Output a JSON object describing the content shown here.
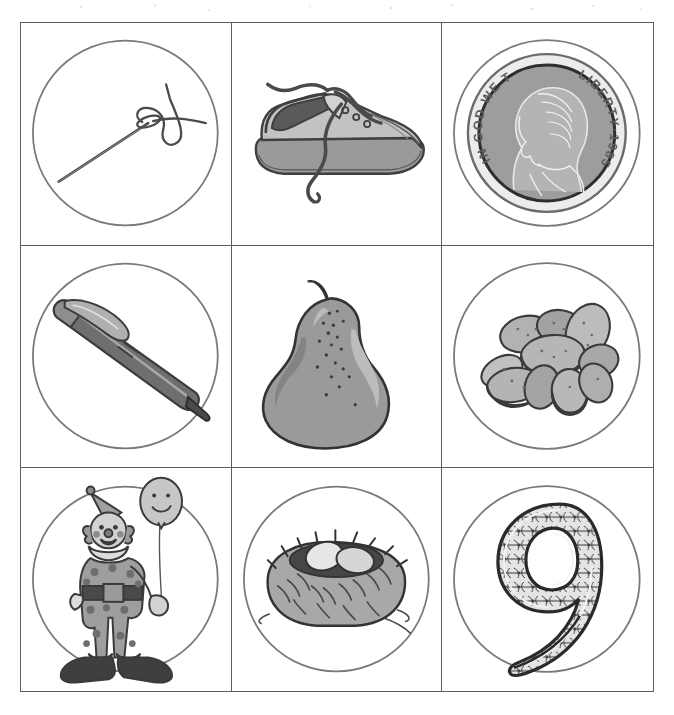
{
  "page": {
    "width": 674,
    "height": 715,
    "background": "#ffffff",
    "border_color": "#5d5d5d",
    "circle_color": "#7a7a7a",
    "ink_color": "#4a4a4a",
    "fill_gray": "#9a9a9a",
    "fill_gray_light": "#bdbdbd",
    "fill_gray_dark": "#6f6f6f"
  },
  "grid": {
    "rows": 3,
    "columns": 3,
    "cells": [
      {
        "index": 1,
        "row": 1,
        "column": 1,
        "item": "needle-and-thread",
        "label": "Needle and thread",
        "has_circle": true,
        "icon_name": "needle-thread-icon"
      },
      {
        "index": 2,
        "row": 1,
        "column": 2,
        "item": "shoe",
        "label": "Shoe",
        "has_circle": false,
        "icon_name": "shoe-icon"
      },
      {
        "index": 3,
        "row": 1,
        "column": 3,
        "item": "nickel-coin",
        "label": "Nickel coin",
        "has_circle": true,
        "icon_name": "nickel-coin-icon",
        "coin_text": {
          "motto": "IN GOD WE TRUST",
          "liberty": "LIBERTY",
          "separator": "·",
          "year": "1985"
        }
      },
      {
        "index": 4,
        "row": 2,
        "column": 1,
        "item": "pen",
        "label": "Pen",
        "has_circle": true,
        "icon_name": "pen-icon"
      },
      {
        "index": 5,
        "row": 2,
        "column": 2,
        "item": "pear",
        "label": "Pear",
        "has_circle": false,
        "icon_name": "pear-icon"
      },
      {
        "index": 6,
        "row": 2,
        "column": 3,
        "item": "nuts",
        "label": "Nuts",
        "has_circle": true,
        "icon_name": "nuts-icon"
      },
      {
        "index": 7,
        "row": 3,
        "column": 1,
        "item": "clown",
        "label": "Clown with balloon",
        "has_circle": true,
        "icon_name": "clown-icon"
      },
      {
        "index": 8,
        "row": 3,
        "column": 2,
        "item": "nest",
        "label": "Nest with eggs",
        "has_circle": true,
        "icon_name": "nest-icon"
      },
      {
        "index": 9,
        "row": 3,
        "column": 3,
        "item": "numeral-nine",
        "label": "Decorative numeral nine",
        "has_circle": true,
        "icon_name": "numeral-nine-icon",
        "numeral": "9"
      }
    ]
  }
}
